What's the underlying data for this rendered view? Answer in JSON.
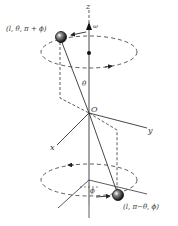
{
  "diagram": {
    "axes": {
      "z_label": "z",
      "x_label": "x",
      "y_label": "y",
      "origin_label": "O"
    },
    "angular_velocity_label": "ω",
    "angle_labels": {
      "theta": "θ",
      "phi": "ϕ"
    },
    "points": {
      "top": {
        "label": "(l, θ, π + ϕ)"
      },
      "bottom": {
        "label": "(l, π−θ, ϕ)"
      }
    },
    "colors": {
      "line": "#333333",
      "sphere": "#222222",
      "background": "#ffffff"
    }
  }
}
